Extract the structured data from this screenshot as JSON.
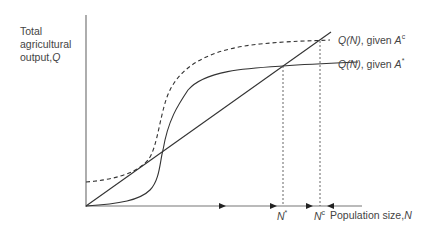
{
  "diagram": {
    "y_axis_label": {
      "line1": "Total",
      "line2": "agricultural",
      "line3": "output,",
      "var": "Q"
    },
    "x_axis_label": {
      "text": "Population size,",
      "var": "N"
    },
    "curves": [
      {
        "name": "Q(N), given A^c",
        "func": "Q(N)",
        "given": ", given ",
        "var": "A",
        "sup": "c",
        "style": "dashed"
      },
      {
        "name": "Q(N), given A*",
        "func": "Q(N)",
        "given": ", given ",
        "var": "A",
        "sup": "*",
        "style": "solid"
      }
    ],
    "equilibria": [
      {
        "var": "N",
        "sup": "*"
      },
      {
        "var": "N",
        "sup": "c"
      }
    ],
    "line": "subsistence line (straight)",
    "colors": {
      "line": "#333333",
      "axis": "#666666"
    }
  }
}
